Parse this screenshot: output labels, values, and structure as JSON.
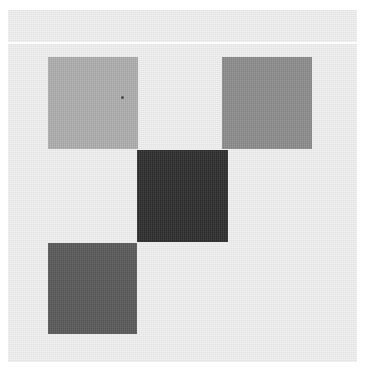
{
  "artwork": {
    "title": "Abstract Geometric Composition",
    "medium_note": "Four gray squares in diagonal checkerboard arrangement on light ground",
    "width": 374,
    "height": 370
  },
  "canvas": {
    "name": "paper-ground",
    "color": "#e8e8e9",
    "x": 8,
    "y": 10,
    "width": 349,
    "height": 352
  },
  "separator": {
    "name": "white-rule",
    "color": "#fdfdfd",
    "x": 8,
    "y": 42,
    "width": 349,
    "height": 2
  },
  "tiles": [
    {
      "id": "top-left",
      "label": "Light gray square",
      "color": "#b0b0b0",
      "x": 48,
      "y": 57,
      "width": 90,
      "height": 92
    },
    {
      "id": "top-right",
      "label": "Medium gray square",
      "color": "#8e8e8e",
      "x": 222,
      "y": 57,
      "width": 90,
      "height": 92
    },
    {
      "id": "center",
      "label": "Near-black square",
      "color": "#2e2e2e",
      "x": 137,
      "y": 150,
      "width": 91,
      "height": 92
    },
    {
      "id": "bottom-left",
      "label": "Dark gray square",
      "color": "#5a5a5a",
      "x": 48,
      "y": 243,
      "width": 89,
      "height": 91
    }
  ],
  "artifacts": [
    {
      "id": "speck",
      "label": "Dark speck",
      "color": "#3a3a3a",
      "x": 121,
      "y": 96,
      "size": 3
    }
  ]
}
